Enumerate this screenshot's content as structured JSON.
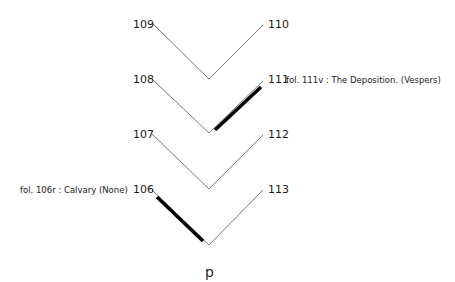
{
  "diagram": {
    "type": "quire-collation",
    "quire_label": "p",
    "bifolia": [
      {
        "left_leaf": "109",
        "right_leaf": "110"
      },
      {
        "left_leaf": "108",
        "right_leaf": "111"
      },
      {
        "left_leaf": "107",
        "right_leaf": "112"
      },
      {
        "left_leaf": "106",
        "right_leaf": "113"
      }
    ],
    "highlighted_leaves": [
      {
        "leaf": "111",
        "annotation": "fol. 111v : The Deposition. (Vespers)"
      },
      {
        "leaf": "106",
        "annotation": "fol. 106r : Calvary (None)"
      }
    ]
  }
}
